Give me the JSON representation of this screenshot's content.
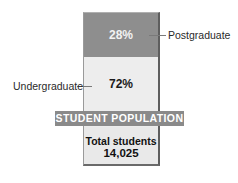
{
  "chart_data": {
    "type": "bar",
    "subtype": "stacked-100-percent",
    "title": "STUDENT POPULATION",
    "categories": [
      "Student population"
    ],
    "series": [
      {
        "name": "Undergraduate",
        "values": [
          72
        ],
        "label": "72%",
        "color": "#ededed"
      },
      {
        "name": "Postgraduate",
        "values": [
          28
        ],
        "label": "28%",
        "color": "#8e8e8e"
      }
    ],
    "total_label": "Total students",
    "total_value": 14025,
    "total_value_display": "14,025",
    "legend": "direct labels with leader lines",
    "ylim": [
      0,
      100
    ],
    "grid": false
  },
  "labels": {
    "postgraduate": "Postgraduate",
    "undergraduate": "Undergraduate",
    "post_pct": "28%",
    "under_pct": "72%",
    "banner": "STUDENT POPULATION",
    "total_label": "Total students",
    "total_value": "14,025"
  },
  "colors": {
    "postgraduate": "#8e8e8e",
    "undergraduate": "#ededed",
    "banner": "#8a8a8a",
    "banner_text": "#ffffff"
  }
}
